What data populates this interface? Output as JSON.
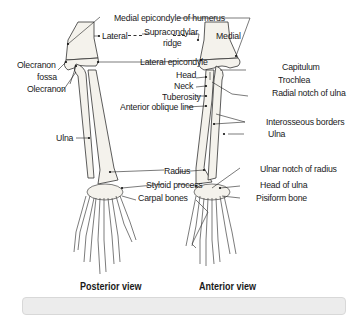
{
  "figure": {
    "views": [
      {
        "id": "posterior",
        "caption": "Posterior view"
      },
      {
        "id": "anterior",
        "caption": "Anterior view"
      }
    ],
    "labels": {
      "medial_epicondyle": "Medial epicondyle of humerus",
      "lateral": "Lateral",
      "supracondylar": "Supracondylar",
      "ridge": "ridge",
      "medial": "Medial",
      "lateral_epicondyle": "Lateral epicondyle",
      "olecranon_fossa_1": "Olecranon",
      "olecranon_fossa_2": "fossa",
      "olecranon": "Olecranon",
      "capitulum": "Capitulum",
      "head": "Head",
      "trochlea": "Trochlea",
      "neck": "Neck",
      "tuberosity": "Tuberosity",
      "radial_notch": "Radial notch of ulna",
      "anterior_oblique_line": "Anterior oblique line",
      "interosseous_borders": "Interosseous borders",
      "ulna_right": "Ulna",
      "ulna_left": "Ulna",
      "radius": "Radius",
      "ulnar_notch": "Ulnar notch of radius",
      "styloid_process": "Styloid process",
      "head_of_ulna": "Head of ulna",
      "carpal_bones": "Carpal bones",
      "pisiform_bone": "Pisiform bone"
    }
  }
}
